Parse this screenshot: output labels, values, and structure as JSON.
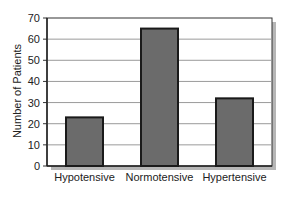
{
  "chart_data": {
    "type": "bar",
    "title": "",
    "xlabel": "",
    "ylabel": "Number of Patients",
    "categories": [
      "Hypotensive",
      "Normotensive",
      "Hypertensive"
    ],
    "values": [
      23,
      65,
      32
    ],
    "ylim": [
      0,
      70
    ],
    "yticks": [
      0,
      10,
      20,
      30,
      40,
      50,
      60,
      70
    ],
    "grid": true,
    "legend": null,
    "colors": {
      "bar_fill": "#6b6b6b",
      "bar_stroke": "#1a1a1a",
      "grid": "#9a9a9a",
      "plot_bg": "#ffffff",
      "shadow": "#7a7a7a"
    }
  }
}
